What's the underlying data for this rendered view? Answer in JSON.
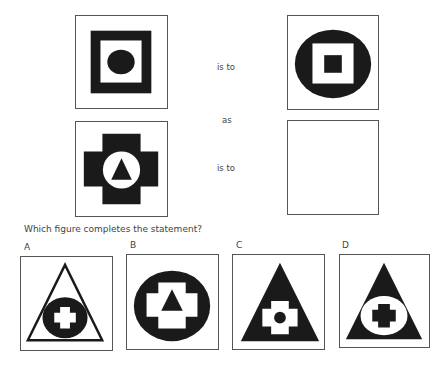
{
  "analogy": {
    "connector_1": "is to",
    "connector_mid": "as",
    "connector_2": "is to",
    "figures": [
      {
        "id": "figure-1",
        "description": "black square frame containing black circle"
      },
      {
        "id": "figure-2",
        "description": "black circle containing white square with black square"
      },
      {
        "id": "figure-3",
        "description": "black cross containing white circle with black triangle"
      },
      {
        "id": "figure-4",
        "description": "empty box"
      }
    ]
  },
  "question": "Which figure completes the statement?",
  "options": [
    {
      "label": "A",
      "description": "outlined triangle with black circle containing white cross"
    },
    {
      "label": "B",
      "description": "black circle containing white cross with black triangle"
    },
    {
      "label": "C",
      "description": "black triangle containing white cross with black circle"
    },
    {
      "label": "D",
      "description": "black triangle containing white circle with black cross"
    }
  ],
  "colors": {
    "fill": "#1a1a1a",
    "border": "#555555",
    "background": "#ffffff"
  }
}
